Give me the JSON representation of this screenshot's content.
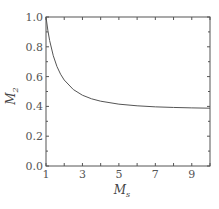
{
  "chart_data": {
    "type": "line",
    "title": "",
    "xlabel": "M_s",
    "ylabel": "M_2",
    "xlim": [
      1,
      10
    ],
    "ylim": [
      0.0,
      1.0
    ],
    "grid": false,
    "legend": null,
    "x_ticks": [
      1,
      3,
      5,
      7,
      9
    ],
    "x_tick_labels": [
      "1",
      "3",
      "5",
      "7",
      "9"
    ],
    "y_ticks": [
      0.0,
      0.2,
      0.4,
      0.6,
      0.8,
      1.0
    ],
    "y_tick_labels": [
      "0.0",
      "0.2",
      "0.4",
      "0.6",
      "0.8",
      "1.0"
    ],
    "series": [
      {
        "name": "M_2",
        "x": [
          1.0,
          1.1,
          1.2,
          1.4,
          1.6,
          1.8,
          2.0,
          2.5,
          3.0,
          3.5,
          4.0,
          5.0,
          6.0,
          7.0,
          8.0,
          9.0,
          10.0
        ],
        "values": [
          1.0,
          0.912,
          0.842,
          0.74,
          0.668,
          0.616,
          0.577,
          0.513,
          0.475,
          0.451,
          0.435,
          0.415,
          0.404,
          0.397,
          0.393,
          0.39,
          0.388
        ]
      }
    ]
  },
  "labels": {
    "x_axis": "M",
    "x_axis_sub": "s",
    "y_axis": "M",
    "y_axis_sub": "2"
  },
  "colors": {
    "line": "#555555",
    "axis": "#555555"
  }
}
